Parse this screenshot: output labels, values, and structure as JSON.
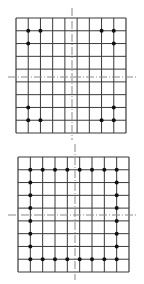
{
  "figures": [
    {
      "id": "top",
      "grid": {
        "x0": 16,
        "y0": 18,
        "x1": 126,
        "y1": 133,
        "cols": 9,
        "rows": 9
      },
      "axis": {
        "cx": 72,
        "cy": 77,
        "h_from": 8,
        "h_to": 136,
        "v_from": 8,
        "v_to": 140
      },
      "dots": [
        [
          1,
          1
        ],
        [
          2,
          1
        ],
        [
          1,
          2
        ],
        [
          7,
          1
        ],
        [
          8,
          1
        ],
        [
          8,
          2
        ],
        [
          1,
          7
        ],
        [
          1,
          8
        ],
        [
          2,
          8
        ],
        [
          7,
          8
        ],
        [
          8,
          8
        ],
        [
          8,
          7
        ]
      ]
    },
    {
      "id": "bottom",
      "grid": {
        "x0": 18,
        "y0": 15,
        "x1": 129,
        "y1": 130,
        "cols": 9,
        "rows": 9
      },
      "axis": {
        "cx": 75,
        "cy": 73,
        "h_from": 8,
        "h_to": 138,
        "v_from": 2,
        "v_to": 138
      },
      "dots": [
        [
          1,
          1
        ],
        [
          2,
          1
        ],
        [
          3,
          1
        ],
        [
          4,
          1
        ],
        [
          5,
          1
        ],
        [
          6,
          1
        ],
        [
          7,
          1
        ],
        [
          8,
          1
        ],
        [
          1,
          8
        ],
        [
          2,
          8
        ],
        [
          3,
          8
        ],
        [
          4,
          8
        ],
        [
          5,
          8
        ],
        [
          6,
          8
        ],
        [
          7,
          8
        ],
        [
          8,
          8
        ],
        [
          1,
          2
        ],
        [
          1,
          3
        ],
        [
          1,
          4
        ],
        [
          1,
          5
        ],
        [
          1,
          6
        ],
        [
          1,
          7
        ],
        [
          8,
          2
        ],
        [
          8,
          3
        ],
        [
          8,
          4
        ],
        [
          8,
          5
        ],
        [
          8,
          6
        ],
        [
          8,
          7
        ]
      ]
    }
  ],
  "colors": {
    "line": "#3a3a3a",
    "axis": "#8a8a8a",
    "dot": "#111111",
    "background": "#ffffff"
  }
}
